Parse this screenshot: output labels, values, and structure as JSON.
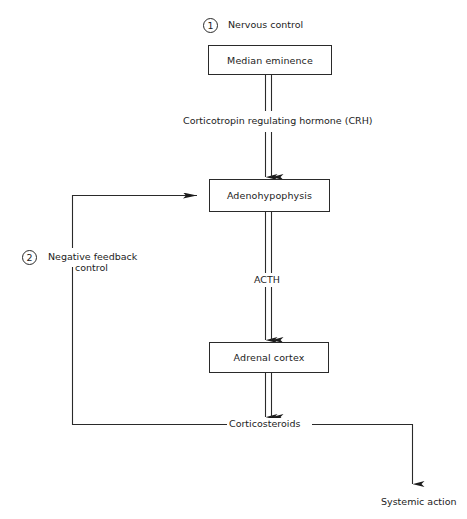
{
  "diagram": {
    "annotations": [
      {
        "number": "1",
        "label": "Nervous control"
      },
      {
        "number": "2",
        "label_line1": "Negative feedback",
        "label_line2": "control"
      }
    ],
    "nodes": [
      {
        "id": "median-eminence",
        "label": "Median eminence"
      },
      {
        "id": "adenohypophysis",
        "label": "Adenohypophysis"
      },
      {
        "id": "adrenal-cortex",
        "label": "Adrenal cortex"
      }
    ],
    "edges": [
      {
        "from": "median-eminence",
        "to": "adenohypophysis",
        "label": "Corticotropin regulating hormone (CRH)"
      },
      {
        "from": "adenohypophysis",
        "to": "adrenal-cortex",
        "label": "ACTH"
      },
      {
        "from": "adrenal-cortex",
        "to": "corticosteroids",
        "label": ""
      }
    ],
    "outputs": {
      "corticosteroids": "Corticosteroids",
      "systemic_action": "Systemic action"
    },
    "colors": {
      "line": "#2a2a2a",
      "background": "#ffffff"
    }
  }
}
